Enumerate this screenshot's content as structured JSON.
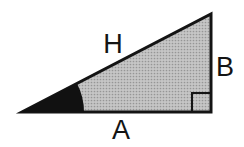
{
  "diagram": {
    "labels": {
      "hypotenuse": "H",
      "vertical_side": "B",
      "horizontal_side": "A"
    },
    "colors": {
      "background": "#ffffff",
      "outline": "#141414",
      "fill_base": "#c6c6c6",
      "fill_dot": "#969696",
      "angle_wedge": "#111111",
      "text": "#141414"
    }
  }
}
